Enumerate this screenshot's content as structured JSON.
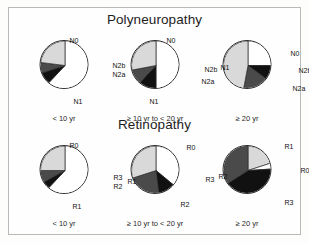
{
  "figure": {
    "background": "#fefefe",
    "border_color": "#b9b9b7"
  },
  "sections": {
    "polyneuropathy_title": "Polyneuropathy",
    "retinopathy_title": "Retinopathy"
  },
  "captions": {
    "lt10": "< 10 yr",
    "mid": "≥ 10 yr to < 20 yr",
    "ge20": "≥ 20 yr"
  },
  "colors": {
    "white": "#ffffff",
    "light_grey": "#d9d9d9",
    "dark_grey": "#4a4a4a",
    "black": "#111111",
    "outline": "#2b2b2b"
  },
  "chart_data": [
    {
      "type": "pie",
      "title": "Polyneuropathy",
      "subtitle": "< 10 yr",
      "categories": [
        "N0",
        "N2b",
        "N2a",
        "N1"
      ],
      "values": [
        62,
        8,
        7,
        23
      ],
      "colors": [
        "#ffffff",
        "#111111",
        "#4a4a4a",
        "#d9d9d9"
      ],
      "start_angle": 0,
      "legend": "none",
      "labels_shown": [
        "N0",
        "N2b",
        "N2a",
        "N1"
      ]
    },
    {
      "type": "pie",
      "title": "Polyneuropathy",
      "subtitle": "≥ 10 yr to < 20 yr",
      "categories": [
        "N0",
        "N2b",
        "N2a",
        "N1"
      ],
      "values": [
        50,
        12,
        10,
        28
      ],
      "colors": [
        "#ffffff",
        "#111111",
        "#4a4a4a",
        "#d9d9d9"
      ],
      "start_angle": 0,
      "legend": "none",
      "labels_shown": [
        "N0",
        "N2b",
        "N2a",
        "N1"
      ]
    },
    {
      "type": "pie",
      "title": "Polyneuropathy",
      "subtitle": "≥ 20 yr",
      "categories": [
        "N0",
        "N2b",
        "N2a",
        "N1"
      ],
      "values": [
        25,
        10,
        18,
        47
      ],
      "colors": [
        "#ffffff",
        "#111111",
        "#4a4a4a",
        "#d9d9d9"
      ],
      "start_angle": 0,
      "legend": "none",
      "labels_shown": [
        "N0",
        "N2b",
        "N2a",
        "N1"
      ]
    },
    {
      "type": "pie",
      "title": "Retinopathy",
      "subtitle": "< 10 yr",
      "categories": [
        "R0",
        "R3",
        "R2",
        "R1"
      ],
      "values": [
        62,
        5,
        8,
        25
      ],
      "colors": [
        "#ffffff",
        "#111111",
        "#4a4a4a",
        "#d9d9d9"
      ],
      "start_angle": 0,
      "legend": "none",
      "labels_shown": [
        "R0",
        "R3",
        "R2",
        "R1"
      ]
    },
    {
      "type": "pie",
      "title": "Retinopathy",
      "subtitle": "≥ 10 yr to < 20 yr",
      "categories": [
        "R0",
        "R3",
        "R2",
        "R1"
      ],
      "values": [
        36,
        12,
        22,
        30
      ],
      "colors": [
        "#ffffff",
        "#111111",
        "#4a4a4a",
        "#d9d9d9"
      ],
      "start_angle": 0,
      "legend": "none",
      "labels_shown": [
        "R0",
        "R3",
        "R2",
        "R1"
      ]
    },
    {
      "type": "pie",
      "title": "Retinopathy",
      "subtitle": "≥ 20 yr",
      "categories": [
        "R1",
        "R0",
        "R3",
        "R2"
      ],
      "values": [
        20,
        4,
        42,
        34
      ],
      "colors": [
        "#d9d9d9",
        "#ffffff",
        "#111111",
        "#4a4a4a"
      ],
      "start_angle": 0,
      "legend": "none",
      "labels_shown": [
        "R1",
        "R0",
        "R3",
        "R2"
      ]
    }
  ],
  "slice_labels": {
    "p1": [
      {
        "text": "N0",
        "x": 30,
        "y": -3
      },
      {
        "text": "N2b",
        "x": 73,
        "y": 22
      },
      {
        "text": "N2a",
        "x": 73,
        "y": 31
      },
      {
        "text": "N1",
        "x": 34,
        "y": 58
      }
    ],
    "p2": [
      {
        "text": "N0",
        "x": 36,
        "y": -3
      },
      {
        "text": "N2b",
        "x": 74,
        "y": 26
      },
      {
        "text": "N2a",
        "x": 71,
        "y": 38
      },
      {
        "text": "N1",
        "x": 19,
        "y": 58
      }
    ],
    "p3": [
      {
        "text": "N0",
        "x": 68,
        "y": 10
      },
      {
        "text": "N2b",
        "x": 76,
        "y": 27
      },
      {
        "text": "N2a",
        "x": 70,
        "y": 45
      },
      {
        "text": "N1",
        "x": -2,
        "y": 24
      }
    ],
    "p4": [
      {
        "text": "R0",
        "x": 30,
        "y": -3
      },
      {
        "text": "R3",
        "x": 74,
        "y": 29
      },
      {
        "text": "R2",
        "x": 74,
        "y": 38
      },
      {
        "text": "R1",
        "x": 33,
        "y": 58
      }
    ],
    "p5": [
      {
        "text": "R0",
        "x": 56,
        "y": -1
      },
      {
        "text": "R3",
        "x": 75,
        "y": 31
      },
      {
        "text": "R2",
        "x": 50,
        "y": 56
      },
      {
        "text": "R1",
        "x": -3,
        "y": 33
      }
    ],
    "p6": [
      {
        "text": "R1",
        "x": 62,
        "y": -2
      },
      {
        "text": "R0",
        "x": 78,
        "y": 22
      },
      {
        "text": "R3",
        "x": 62,
        "y": 54
      },
      {
        "text": "R2",
        "x": -4,
        "y": 28
      }
    ]
  }
}
